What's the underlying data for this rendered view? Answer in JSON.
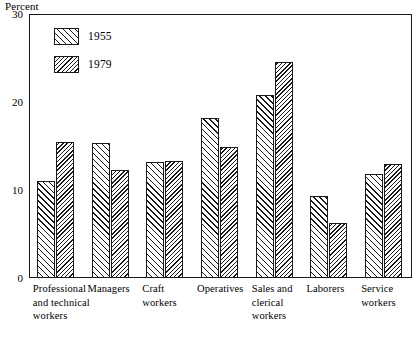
{
  "chart_data": {
    "type": "bar",
    "title": "",
    "subtitle": "",
    "xlabel": "",
    "ylabel": "Percent",
    "ylim": [
      0,
      30
    ],
    "yticks": [
      0,
      10,
      20,
      30
    ],
    "ytick_labels": [
      "0",
      "10",
      "20",
      "30"
    ],
    "grid": false,
    "legend_position": "top-left",
    "categories": [
      "Professional\nand technical\nworkers",
      "Managers",
      "Craft\nworkers",
      "Operatives",
      "Sales and\nclerical\nworkers",
      "Laborers",
      "Service\nworkers"
    ],
    "series": [
      {
        "name": "1955",
        "pattern": "sparse-diagonal-hatch",
        "values": [
          11.0,
          15.3,
          13.2,
          18.2,
          20.8,
          9.3,
          11.8
        ]
      },
      {
        "name": "1979",
        "pattern": "dense-diagonal-hatch",
        "values": [
          15.5,
          12.3,
          13.3,
          14.9,
          24.6,
          6.2,
          13.0
        ]
      }
    ]
  },
  "axis": {
    "unit_caption": "Percent",
    "y_tick_labels": [
      "30",
      "20",
      "10",
      "0"
    ]
  },
  "legend": {
    "items": [
      {
        "label": "1955"
      },
      {
        "label": "1979"
      }
    ]
  },
  "x_axis": {
    "labels": [
      "Professional\nand technical\nworkers",
      "Managers",
      "Craft\nworkers",
      "Operatives",
      "Sales and\nclerical\nworkers",
      "Laborers",
      "Service\nworkers"
    ]
  }
}
